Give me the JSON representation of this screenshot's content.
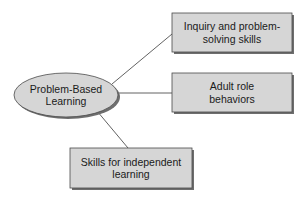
{
  "diagram": {
    "center": {
      "label_line1": "Problem-Based",
      "label_line2": "Learning"
    },
    "nodes": [
      {
        "label_line1": "Inquiry and problem-",
        "label_line2": "solving skills"
      },
      {
        "label_line1": "Adult role",
        "label_line2": "behaviors"
      },
      {
        "label_line1": "Skills for independent",
        "label_line2": "learning"
      }
    ],
    "colors": {
      "fill": "#d6d6d6",
      "stroke": "#4a4a4a",
      "shadow": "#6e6e6e",
      "line": "#3a3a3a"
    }
  }
}
